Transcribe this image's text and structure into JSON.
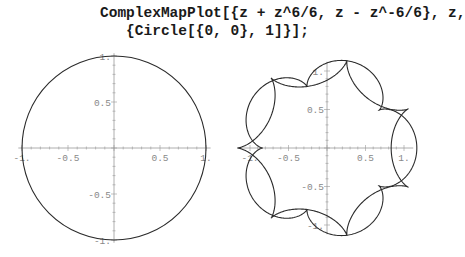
{
  "code": {
    "line1": "ComplexMapPlot[{z + z^6/6, z - z^-6/6}, z,",
    "line2": "   {Circle[{0, 0}, 1]}];"
  },
  "chart_data": [
    {
      "type": "line",
      "title": "Circle[{0,0},1]",
      "description": "Unit circle in the complex plane",
      "xlim": [
        -1,
        1
      ],
      "ylim": [
        -1,
        1
      ],
      "x_ticks": [
        "-1.",
        "-0.5",
        "0.5",
        "1."
      ],
      "y_ticks": [
        "-1.",
        "-0.5",
        "0.5",
        "1."
      ],
      "series": [
        {
          "name": "circle",
          "formula": "e^{it}",
          "radius": 1
        }
      ],
      "grid": false
    },
    {
      "type": "line",
      "title": "Image of unit circle under z + z^6/6 and z - z^-6/6",
      "xlim": [
        -1.2,
        1.2
      ],
      "ylim": [
        -1.2,
        1.2
      ],
      "x_ticks": [
        "-1.",
        "-0.5",
        "0.5",
        "1."
      ],
      "y_ticks": [
        "-1.",
        "-0.5",
        "0.5",
        "1."
      ],
      "series": [
        {
          "name": "z + z^6/6",
          "n": 6,
          "sign": 1
        },
        {
          "name": "z - z^-6/6",
          "n": -6,
          "sign": -1
        }
      ],
      "grid": false
    }
  ],
  "colors": {
    "curve": "#2a2a2a",
    "axis": "#999999",
    "tick_label": "#888888"
  }
}
